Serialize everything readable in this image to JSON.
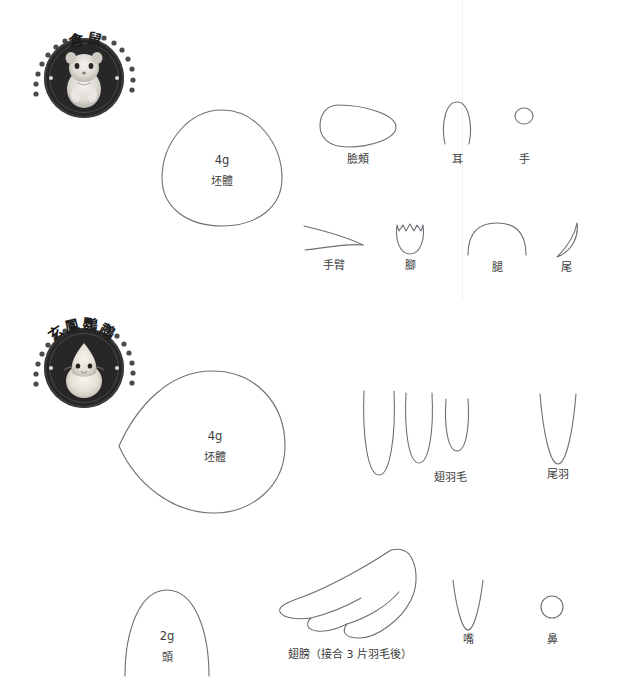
{
  "page": {
    "width": 634,
    "height": 700,
    "background_color": "#ffffff",
    "outline_color": "#6c6f76",
    "badge_color": "#272727"
  },
  "sections": [
    {
      "id": "hamster",
      "badge": {
        "title": "倉鼠",
        "photo_alt": "hamster-photo",
        "icon": "round-badge-icon"
      },
      "body": {
        "weight": "4g",
        "name": "坯體"
      },
      "parts": [
        {
          "id": "cheek",
          "label": "臉頰",
          "shape": "egg-horizontal"
        },
        {
          "id": "ear",
          "label": "耳",
          "shape": "open-arch"
        },
        {
          "id": "hand",
          "label": "手",
          "shape": "small-circle"
        },
        {
          "id": "arm",
          "label": "手臂",
          "shape": "two-curves-lens"
        },
        {
          "id": "foot",
          "label": "腳",
          "shape": "tulip"
        },
        {
          "id": "leg",
          "label": "腿",
          "shape": "wide-arch"
        },
        {
          "id": "tail",
          "label": "尾",
          "shape": "crescent"
        }
      ]
    },
    {
      "id": "cockatiel",
      "badge": {
        "title": "玄鳳鸚鵡",
        "photo_alt": "cockatiel-photo",
        "icon": "round-badge-icon"
      },
      "body": {
        "weight": "4g",
        "name": "坯體"
      },
      "head": {
        "weight": "2g",
        "name": "頭"
      },
      "parts": [
        {
          "id": "wing-feather",
          "label": "翅羽毛",
          "shape": "three-u-feathers"
        },
        {
          "id": "tail-feather",
          "label": "尾羽",
          "shape": "narrow-v-feather"
        },
        {
          "id": "wing",
          "label": "翅膀（接合 3 片羽毛後）",
          "shape": "three-segment-wing"
        },
        {
          "id": "beak",
          "label": "嘴",
          "shape": "narrow-v"
        },
        {
          "id": "nose",
          "label": "鼻",
          "shape": "small-circle"
        }
      ]
    }
  ]
}
